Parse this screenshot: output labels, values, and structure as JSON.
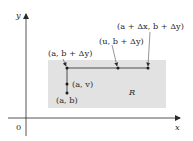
{
  "diagram": {
    "colors": {
      "background": "#ffffff",
      "region_fill": "#e2e2e2",
      "stroke": "#2a2a2a"
    },
    "axes": {
      "x_label": "x",
      "y_label": "y",
      "origin_label": "0"
    },
    "region": {
      "label": "R"
    },
    "points": [
      {
        "id": "a-b-plus-dy",
        "label": "(a, b + Δy)"
      },
      {
        "id": "u-b-plus-dy",
        "label": "(u, b + Δy)"
      },
      {
        "id": "a-plus-dx-b-plus-dy",
        "label": "(a + Δx, b + Δy)"
      },
      {
        "id": "a-v",
        "label": "(a, v)"
      },
      {
        "id": "a-b",
        "label": "(a, b)"
      }
    ]
  }
}
